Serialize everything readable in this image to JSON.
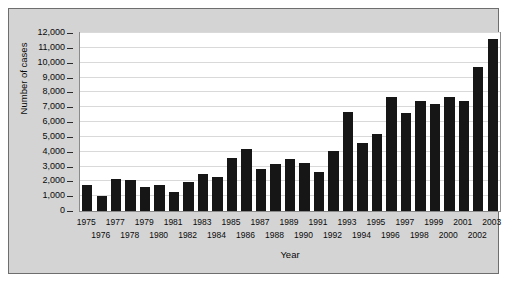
{
  "chart_data": {
    "type": "bar",
    "title": "",
    "xlabel": "Year",
    "ylabel": "Number of cases",
    "categories": [
      "1975",
      "1976",
      "1977",
      "1978",
      "1979",
      "1980",
      "1981",
      "1982",
      "1983",
      "1984",
      "1985",
      "1986",
      "1987",
      "1988",
      "1989",
      "1990",
      "1991",
      "1992",
      "1993",
      "1994",
      "1995",
      "1996",
      "1997",
      "1998",
      "1999",
      "2000",
      "2001",
      "2002",
      "2003"
    ],
    "values": [
      1750,
      1030,
      2180,
      2080,
      1630,
      1750,
      1280,
      1930,
      2480,
      2300,
      3600,
      4200,
      2850,
      3200,
      3500,
      3250,
      2600,
      4050,
      6700,
      4600,
      5200,
      7700,
      6600,
      7450,
      7200,
      7700,
      7450,
      9700,
      11600
    ],
    "ylim": [
      0,
      12000
    ],
    "ytick_values": [
      0,
      1000,
      2000,
      3000,
      4000,
      5000,
      6000,
      7000,
      8000,
      9000,
      10000,
      11000,
      12000
    ],
    "ytick_labels": [
      "0",
      "1,000",
      "2,000",
      "3,000",
      "4,000",
      "5,000",
      "6,000",
      "7,000",
      "8,000",
      "9,000",
      "10,000",
      "11,000",
      "12,000"
    ],
    "grid": true,
    "legend": false,
    "legend_position": "none",
    "bar_color": "#161616",
    "plot_background": "#ffffff",
    "panel_background": "#d4d4d4",
    "gridline_color": "#d9d9d9"
  }
}
